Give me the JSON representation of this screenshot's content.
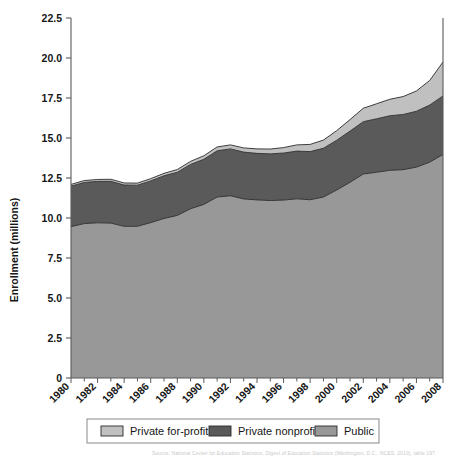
{
  "figure": {
    "background_color": "#ffffff",
    "plot_left": 71,
    "plot_right": 443,
    "plot_top": 18,
    "plot_bottom": 378,
    "axis_color": "#5a5a5a"
  },
  "axis": {
    "ylabel": "Enrollment (millions)",
    "yticks": [
      "0",
      "2.5",
      "5.0",
      "7.5",
      "10.0",
      "12.5",
      "15.0",
      "17.5",
      "20.0",
      "22.5"
    ],
    "xticks": [
      "1980",
      "1982",
      "1984",
      "1986",
      "1988",
      "1990",
      "1992",
      "1994",
      "1996",
      "1998",
      "2000",
      "2002",
      "2004",
      "2006",
      "2008"
    ]
  },
  "legend": {
    "items": [
      {
        "label": "Private for-profit",
        "color": "#c0c0c0"
      },
      {
        "label": "Private nonprofit",
        "color": "#5a5a5a"
      },
      {
        "label": "Public",
        "color": "#989898"
      }
    ]
  },
  "source": {
    "text": "Source: National Center for Education Statistics, Digest of Education Statistics (Washington, D.C.: NCES, 2010), table 197."
  },
  "chart_data": {
    "type": "area",
    "stacked": true,
    "title": "",
    "xlabel": "",
    "ylabel": "Enrollment (millions)",
    "xlim": [
      1980,
      2008
    ],
    "ylim": [
      0,
      22.5
    ],
    "grid": false,
    "legend_position": "bottom",
    "x": [
      1980,
      1981,
      1982,
      1983,
      1984,
      1985,
      1986,
      1987,
      1988,
      1989,
      1990,
      1991,
      1992,
      1993,
      1994,
      1995,
      1996,
      1997,
      1998,
      1999,
      2000,
      2001,
      2002,
      2003,
      2004,
      2005,
      2006,
      2007,
      2008
    ],
    "series": [
      {
        "name": "Public",
        "color": "#989898",
        "values": [
          9.46,
          9.65,
          9.7,
          9.68,
          9.48,
          9.48,
          9.71,
          9.97,
          10.16,
          10.58,
          10.85,
          11.31,
          11.39,
          11.19,
          11.13,
          11.09,
          11.12,
          11.2,
          11.14,
          11.31,
          11.75,
          12.23,
          12.75,
          12.86,
          12.98,
          13.02,
          13.18,
          13.49,
          13.97
        ],
        "endpoint_label": "13.97"
      },
      {
        "name": "Private nonprofit",
        "color": "#5a5a5a",
        "values": [
          2.53,
          2.57,
          2.59,
          2.61,
          2.58,
          2.57,
          2.61,
          2.67,
          2.7,
          2.77,
          2.82,
          2.89,
          2.93,
          2.93,
          2.91,
          2.92,
          2.94,
          2.98,
          3.01,
          3.05,
          3.11,
          3.2,
          3.27,
          3.34,
          3.41,
          3.45,
          3.49,
          3.57,
          3.66
        ],
        "endpoint_label": "3.66"
      },
      {
        "name": "Private for-profit",
        "color": "#c0c0c0",
        "values": [
          0.11,
          0.12,
          0.12,
          0.13,
          0.13,
          0.13,
          0.14,
          0.15,
          0.17,
          0.19,
          0.22,
          0.24,
          0.25,
          0.26,
          0.28,
          0.3,
          0.34,
          0.39,
          0.45,
          0.51,
          0.6,
          0.72,
          0.84,
          0.94,
          1.03,
          1.12,
          1.27,
          1.54,
          2.12
        ],
        "endpoint_label": "2.12"
      }
    ],
    "totals": [
      12.1,
      12.34,
      12.41,
      12.42,
      12.19,
      12.18,
      12.46,
      12.79,
      13.03,
      13.54,
      13.89,
      14.44,
      14.57,
      14.38,
      14.32,
      14.31,
      14.4,
      14.57,
      14.6,
      14.87,
      15.46,
      16.15,
      16.86,
      17.14,
      17.42,
      17.59,
      17.94,
      18.6,
      19.75
    ]
  }
}
